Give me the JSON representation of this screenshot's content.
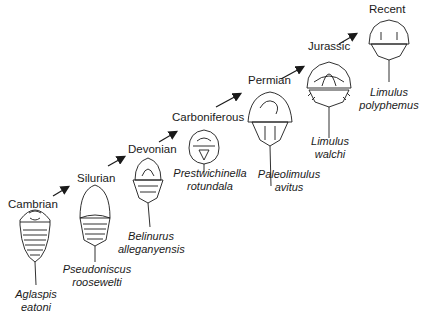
{
  "figure": {
    "stages": [
      {
        "era": "Cambrian",
        "genus": "Aglaspis",
        "species": "eatoni"
      },
      {
        "era": "Silurian",
        "genus": "Pseudoniscus",
        "species": "roosewelti"
      },
      {
        "era": "Devonian",
        "genus": "Belinurus",
        "species": "alleganyensis"
      },
      {
        "era": "Carboniferous",
        "genus": "Prestwichinella",
        "species": "rotundala"
      },
      {
        "era": "Permian",
        "genus": "Paleolimulus",
        "species": "avitus"
      },
      {
        "era": "Jurassic",
        "genus": "Limulus",
        "species": "walchi"
      },
      {
        "era": "Recent",
        "genus": "Limulus",
        "species": "polyphemus"
      }
    ],
    "colors": {
      "ink": "#1a1a1a",
      "background": "#ffffff"
    }
  }
}
